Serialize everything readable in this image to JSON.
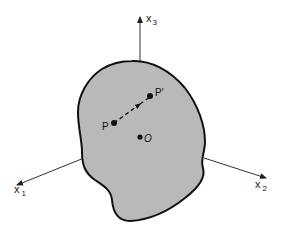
{
  "diagram": {
    "type": "3d-body-with-coordinate-axes",
    "colors": {
      "background": "#ffffff",
      "body_fill": "#b9b9b9",
      "outline": "#111111",
      "axis": "#333333"
    },
    "axes": [
      {
        "id": "x1",
        "var": "x",
        "sub": "1"
      },
      {
        "id": "x2",
        "var": "x",
        "sub": "2"
      },
      {
        "id": "x3",
        "var": "x",
        "sub": "3"
      }
    ],
    "points": {
      "P": "P",
      "P_prime": "P′",
      "O": "O"
    },
    "displacement_arrow": {
      "from": "P",
      "to": "P′",
      "style": "dashed"
    }
  }
}
